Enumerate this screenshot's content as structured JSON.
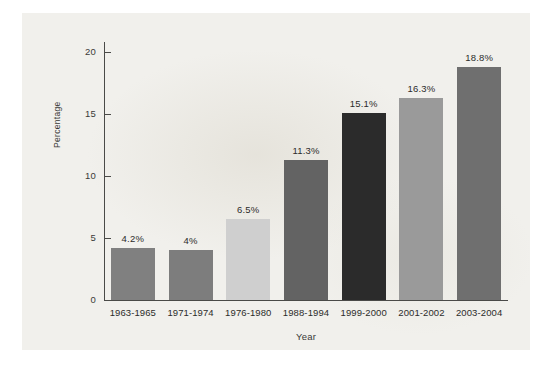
{
  "chart_data": {
    "type": "bar",
    "title": "",
    "xlabel": "Year",
    "ylabel": "Percentage",
    "categories": [
      "1963-1965",
      "1971-1974",
      "1976-1980",
      "1988-1994",
      "1999-2000",
      "2001-2002",
      "2003-2004"
    ],
    "values": [
      4.2,
      4.0,
      6.5,
      11.3,
      15.1,
      16.3,
      18.8
    ],
    "value_labels": [
      "4.2%",
      "4%",
      "6.5%",
      "11.3%",
      "15.1%",
      "16.3%",
      "18.8%"
    ],
    "bar_colors": [
      "#808080",
      "#7d7d7d",
      "#cfcfcf",
      "#636363",
      "#2b2b2b",
      "#9a9a9a",
      "#6f6f6f"
    ],
    "ylim": [
      0,
      21.5
    ],
    "yticks": [
      0,
      5,
      10,
      15,
      20
    ],
    "ytick_labels": [
      "0",
      "5",
      "10",
      "15",
      "20"
    ],
    "grid": false,
    "legend": "none",
    "background_color": "#f1f0ec",
    "axis_color": "#4a4a48"
  },
  "axes": {
    "y_title": "Percentage",
    "x_title": "Year"
  }
}
